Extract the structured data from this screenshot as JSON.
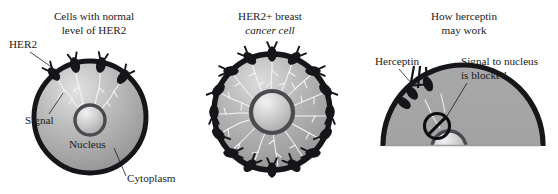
{
  "figure": {
    "caption_alt": "Mechanism of HER2 signalling and herceptin blockade",
    "background_color": "#ffffff",
    "ink_color": "#1a1a1a",
    "membrane_color": "#15151a",
    "cytoplasm_light": "#d8d8d8",
    "cytoplasm_dark": "#8e8e8e",
    "nucleus_light": "#ededed",
    "nucleus_dark": "#9a9a9a",
    "signal_color": "#f4f4f2"
  },
  "panels": [
    {
      "id": "normal-cell",
      "title_line1": "Cells with normal",
      "title_line2": "level of HER2",
      "title_italic": false,
      "receptor_count": 4,
      "labels": [
        {
          "name": "her2",
          "text": "HER2"
        },
        {
          "name": "signal",
          "text": "Signal"
        },
        {
          "name": "nucleus",
          "text": "Nucleus"
        },
        {
          "name": "cytoplasm",
          "text": "Cytoplasm"
        }
      ]
    },
    {
      "id": "her2-positive-cell",
      "title_line1": "HER2+ breast",
      "title_line2": "cancer cell",
      "title_italic": true,
      "receptor_count": 16,
      "labels": []
    },
    {
      "id": "herceptin-action",
      "title_line1": "How herceptin",
      "title_line2": "may work",
      "title_italic": false,
      "receptor_count": 3,
      "labels": [
        {
          "name": "herceptin",
          "text": "Herceptin"
        },
        {
          "name": "blocked-line1",
          "text": "Signal to nucleus"
        },
        {
          "name": "blocked-line2",
          "text": "is blocked"
        }
      ]
    }
  ]
}
